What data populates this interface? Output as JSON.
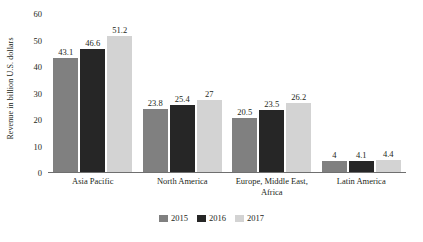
{
  "chart_data": {
    "type": "bar",
    "title": "",
    "xlabel": "",
    "ylabel": "Revenue in billion U.S. dollars",
    "ylim": [
      0,
      60
    ],
    "yticks": [
      0,
      10,
      20,
      30,
      40,
      50,
      60
    ],
    "ytick_labels": [
      "0",
      "10",
      "20",
      "30",
      "40",
      "50",
      "60"
    ],
    "grid": false,
    "legend_position": "bottom-center",
    "categories": [
      "Asia Pacific",
      "North America",
      "Europe, Middle East, Africa",
      "Latin America"
    ],
    "series": [
      {
        "name": "2015",
        "color": "#808080",
        "values": [
          43.1,
          23.8,
          20.5,
          4
        ],
        "labels": [
          "43.1",
          "23.8",
          "20.5",
          "4"
        ]
      },
      {
        "name": "2016",
        "color": "#262626",
        "values": [
          46.6,
          25.4,
          23.5,
          4.1
        ],
        "labels": [
          "46.6",
          "25.4",
          "23.5",
          "4.1"
        ]
      },
      {
        "name": "2017",
        "color": "#d3d3d3",
        "values": [
          51.2,
          27,
          26.2,
          4.4
        ],
        "labels": [
          "51.2",
          "27",
          "26.2",
          "4.4"
        ]
      }
    ]
  },
  "colors": {
    "background": "#ffffff",
    "text": "#231f20",
    "axis": "#6f6f6f",
    "series_2015": "#808080",
    "series_2016": "#262626",
    "series_2017": "#d3d3d3"
  }
}
